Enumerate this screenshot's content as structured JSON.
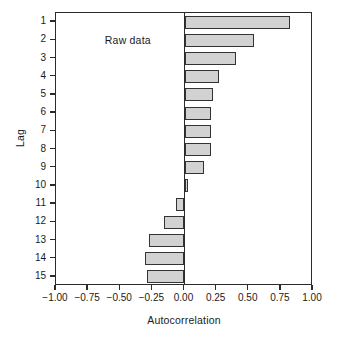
{
  "chart_data": {
    "type": "bar",
    "orientation": "horizontal",
    "title": "",
    "xlabel": "Autocorrelation",
    "ylabel": "Lag",
    "categories": [
      "1",
      "2",
      "3",
      "4",
      "5",
      "6",
      "7",
      "8",
      "9",
      "10",
      "11",
      "12",
      "13",
      "14",
      "15"
    ],
    "values": [
      0.82,
      0.54,
      0.4,
      0.27,
      0.22,
      0.21,
      0.21,
      0.21,
      0.155,
      0.03,
      -0.07,
      -0.16,
      -0.28,
      -0.31,
      -0.29
    ],
    "xlim": [
      -1.0,
      1.0
    ],
    "xticks": [
      -1.0,
      -0.75,
      -0.5,
      -0.25,
      0.0,
      0.25,
      0.5,
      0.75,
      1.0
    ],
    "xticklabels": [
      "−1.00",
      "−0.75",
      "−0.50",
      "−0.25",
      "0.00",
      "0.25",
      "0.50",
      "0.75",
      "1.00"
    ],
    "grid": false,
    "legend": "none",
    "annotations": [
      {
        "text": "Raw data",
        "x": -0.62,
        "y": 2
      }
    ],
    "bar_fill_color": "#d2d2d2",
    "bar_edge_color": "#333333",
    "axis_color": "#2b2b2b",
    "background_color": "#ffffff"
  }
}
